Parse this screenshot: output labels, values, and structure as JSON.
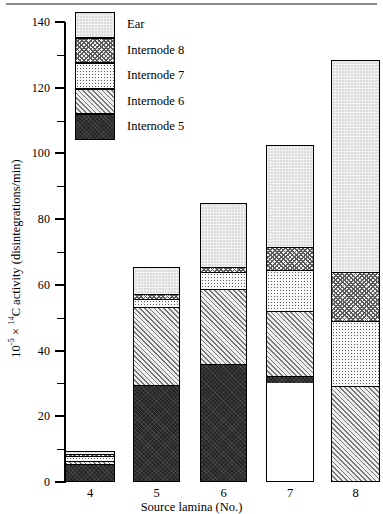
{
  "chart_data": {
    "type": "bar",
    "subtype": "stacked-bar",
    "title": "",
    "xlabel": "Source lamina (No.)",
    "ylabel": "10⁻⁵ × ¹⁴C activity (disintegrations/min)",
    "ylabel_parts": {
      "prefix": "10",
      "exponent1": "-5",
      "times": " × ",
      "exponent2": "14",
      "suffix": "C activity (disintegrations/min)"
    },
    "categories": [
      "4",
      "5",
      "6",
      "7",
      "8"
    ],
    "ylim": [
      0,
      140
    ],
    "ymajor_ticks": [
      0,
      20,
      40,
      60,
      80,
      100,
      120,
      140
    ],
    "yminor_ticks": [
      10,
      30,
      50,
      70,
      90,
      110,
      130
    ],
    "ytick_labels": [
      "0",
      "20",
      "40",
      "60",
      "80",
      "100",
      "120",
      "140"
    ],
    "grid": false,
    "legend_position": "top-left-inside",
    "series": [
      {
        "name": "Internode 5",
        "pattern": "dark-solid",
        "color": "#262626",
        "values": [
          5.5,
          29.5,
          36.0,
          2.0,
          0.0
        ]
      },
      {
        "name": "Internode 6",
        "pattern": "diagonal-hatch",
        "color": "#efefef",
        "values": [
          1.0,
          24.0,
          23.0,
          20.0,
          29.0
        ]
      },
      {
        "name": "Internode 7",
        "pattern": "fine-stipple",
        "color": "#fafafa",
        "values": [
          1.5,
          2.5,
          5.0,
          12.5,
          20.0
        ]
      },
      {
        "name": "Internode 8",
        "pattern": "cross-hatch",
        "color": "#f2f2f2",
        "values": [
          0.8,
          1.5,
          1.5,
          7.0,
          15.0
        ]
      },
      {
        "name": "Ear",
        "pattern": "light-texture",
        "color": "#dcdcdc",
        "values": [
          0.7,
          8.0,
          19.5,
          31.0,
          64.5
        ]
      }
    ],
    "totals": [
      9.5,
      65.5,
      85.0,
      102.5,
      128.5
    ]
  },
  "legend": {
    "items": [
      {
        "label": "Ear",
        "pattern_class": "p-ear"
      },
      {
        "label": "Internode 8",
        "pattern_class": "p-i8"
      },
      {
        "label": "Internode 7",
        "pattern_class": "p-i7"
      },
      {
        "label": "Internode 6",
        "pattern_class": "p-i6"
      },
      {
        "label": "Internode 5",
        "pattern_class": "p-i5"
      }
    ]
  }
}
